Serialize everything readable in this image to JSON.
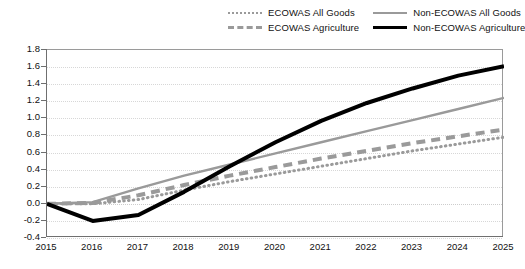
{
  "chart_data": {
    "type": "line",
    "title": "",
    "subtitle": "",
    "xlabel": "",
    "ylabel": "",
    "x": [
      2015,
      2016,
      2017,
      2018,
      2019,
      2020,
      2021,
      2022,
      2023,
      2024,
      2025
    ],
    "categories": [
      "2015",
      "2016",
      "2017",
      "2018",
      "2019",
      "2020",
      "2021",
      "2022",
      "2023",
      "2024",
      "2025"
    ],
    "xlim": [
      2015,
      2025
    ],
    "ylim": [
      -0.4,
      1.8
    ],
    "ytick_step": 0.2,
    "yticks": [
      -0.4,
      -0.2,
      0.0,
      0.2,
      0.4,
      0.6,
      0.8,
      1.0,
      1.2,
      1.4,
      1.6,
      1.8
    ],
    "ytick_labels": [
      "-0.4",
      "-0.2",
      "0.0",
      "0.2",
      "0.4",
      "0.6",
      "0.8",
      "1.0",
      "1.2",
      "1.4",
      "1.6",
      "1.8"
    ],
    "grid": true,
    "grid_axis": "y",
    "grid_style": "dotted",
    "legend_position": "top-right",
    "series": [
      {
        "name": "ECOWAS All Goods",
        "style": "dotted",
        "color": "#9a9a9a",
        "width": 3,
        "values": [
          0.0,
          0.0,
          0.05,
          0.16,
          0.26,
          0.35,
          0.44,
          0.53,
          0.62,
          0.7,
          0.78
        ]
      },
      {
        "name": "ECOWAS Agriculture",
        "style": "dashed",
        "color": "#9a9a9a",
        "width": 4,
        "values": [
          0.0,
          0.01,
          0.1,
          0.22,
          0.33,
          0.43,
          0.53,
          0.62,
          0.71,
          0.79,
          0.87
        ]
      },
      {
        "name": "Non-ECOWAS All Goods",
        "style": "solid",
        "color": "#9a9a9a",
        "width": 2.4,
        "values": [
          0.0,
          0.02,
          0.18,
          0.33,
          0.46,
          0.59,
          0.72,
          0.85,
          0.98,
          1.11,
          1.24
        ]
      },
      {
        "name": "Non-ECOWAS Agriculture",
        "style": "solid",
        "color": "#000000",
        "width": 4,
        "values": [
          0.0,
          -0.2,
          -0.13,
          0.14,
          0.44,
          0.72,
          0.97,
          1.18,
          1.35,
          1.5,
          1.61
        ]
      }
    ]
  },
  "legend": {
    "items": [
      {
        "label": "ECOWAS All Goods",
        "swatch": "dotted-gray-line-icon"
      },
      {
        "label": "Non-ECOWAS All Goods",
        "swatch": "solid-gray-line-icon"
      },
      {
        "label": "ECOWAS Agriculture",
        "swatch": "dashed-gray-line-icon"
      },
      {
        "label": "Non-ECOWAS Agriculture",
        "swatch": "solid-black-line-icon"
      }
    ]
  }
}
